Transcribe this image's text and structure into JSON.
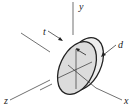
{
  "diagram": {
    "labels": {
      "y": "y",
      "x": "x",
      "z": "z",
      "t": "t",
      "d": "d"
    },
    "colors": {
      "disk_face": "#dcdcdc",
      "disk_rim": "#eeeeee",
      "stroke": "#222222"
    }
  }
}
